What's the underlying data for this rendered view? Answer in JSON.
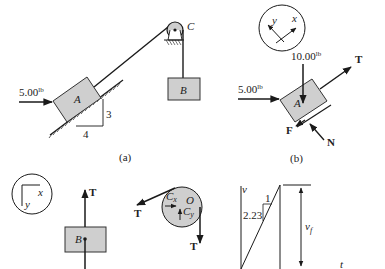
{
  "colors": {
    "ink": "#1a1a1a",
    "block_fill": "#cfcfcf",
    "block_stroke": "#333333"
  },
  "panel_a": {
    "caption": "(a)",
    "applied_force": "5.00",
    "applied_force_unit": "lb",
    "block_a_label": "A",
    "block_b_label": "B",
    "pulley_label": "C",
    "slope_rise": "3",
    "slope_run": "4"
  },
  "panel_b": {
    "caption": "(b)",
    "axis_x": "x",
    "axis_y": "y",
    "weight": "10.00",
    "weight_unit": "lb",
    "applied_force": "5.00",
    "applied_force_unit": "lb",
    "block_label": "A",
    "tension": "T",
    "friction": "F",
    "normal": "N"
  },
  "panel_c": {
    "axis_x": "x",
    "axis_y": "y",
    "block_label": "B",
    "tension": "T"
  },
  "panel_d": {
    "cx": "C",
    "cx_sub": "x",
    "cy": "C",
    "cy_sub": "y",
    "center": "O",
    "tension_left": "T",
    "tension_down": "T"
  },
  "panel_e": {
    "v_axis": "v",
    "t_axis": "t",
    "slope_run": "1",
    "slope_rise": "2.23",
    "final_velocity": "v",
    "final_velocity_sub": "f"
  }
}
